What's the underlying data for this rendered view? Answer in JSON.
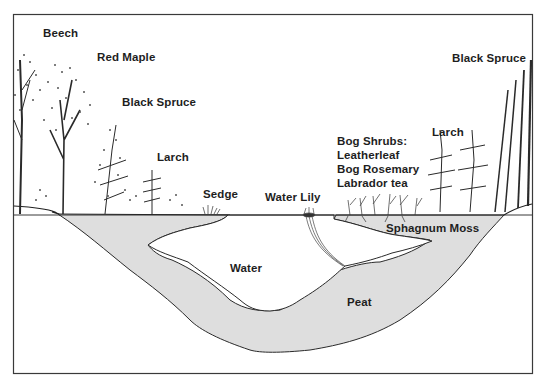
{
  "diagram": {
    "type": "cross-section",
    "colors": {
      "background": "#ffffff",
      "frame": "#3a3a3a",
      "peat_fill": "#dedede",
      "ink": "#1e1e1e"
    },
    "labels": {
      "beech": "Beech",
      "red_maple": "Red Maple",
      "black_spruce_left": "Black Spruce",
      "larch_left": "Larch",
      "sedge": "Sedge",
      "water_lily": "Water Lily",
      "bog_shrubs": {
        "heading": "Bog Shrubs:",
        "items": [
          "Leatherleaf",
          "Bog Rosemary",
          "Labrador tea"
        ]
      },
      "larch_right": "Larch",
      "black_spruce_right": "Black Spruce",
      "sphagnum_moss": "Sphagnum Moss",
      "water": "Water",
      "peat": "Peat"
    }
  }
}
